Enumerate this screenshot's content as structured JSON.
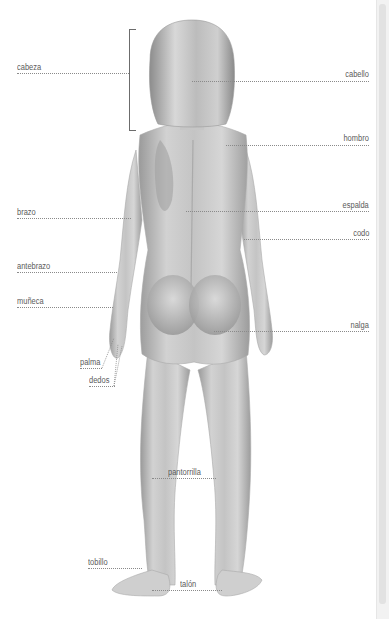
{
  "header": {
    "title_partial": "· · · · · · · · ·"
  },
  "diagram": {
    "labels_left": [
      {
        "id": "cabeza",
        "text": "cabeza"
      },
      {
        "id": "brazo",
        "text": "brazo"
      },
      {
        "id": "antebrazo",
        "text": "antebrazo"
      },
      {
        "id": "muneca",
        "text": "muñeca"
      },
      {
        "id": "palma",
        "text": "palma"
      },
      {
        "id": "dedos",
        "text": "dedos"
      },
      {
        "id": "tobillo",
        "text": "tobillo"
      }
    ],
    "labels_right": [
      {
        "id": "cabello",
        "text": "cabello"
      },
      {
        "id": "hombro",
        "text": "hombro"
      },
      {
        "id": "espalda",
        "text": "espalda"
      },
      {
        "id": "codo",
        "text": "codo"
      },
      {
        "id": "nalga",
        "text": "nalga"
      }
    ],
    "labels_center": [
      {
        "id": "pantorrilla",
        "text": "pantorrilla"
      },
      {
        "id": "talon",
        "text": "talón"
      }
    ]
  },
  "colors": {
    "label_text": "#5a5a5a",
    "leader_line": "#8a8a8a",
    "skin_mid": "#c9c9c9",
    "skin_dark": "#8e8e8e"
  }
}
